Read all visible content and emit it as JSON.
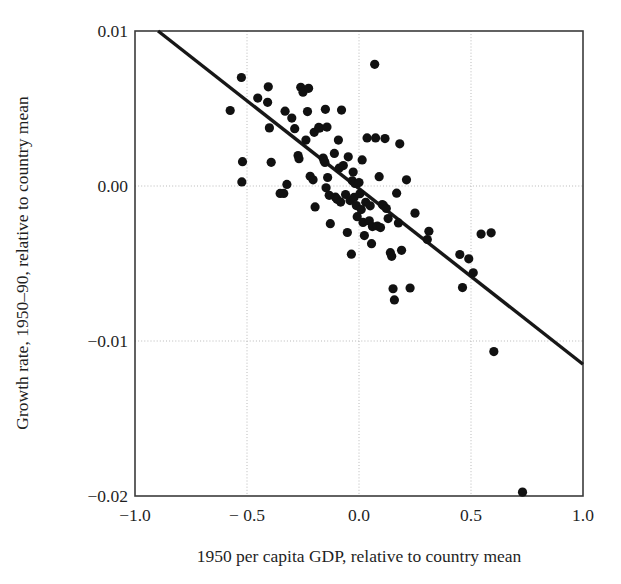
{
  "chart_data": {
    "type": "scatter",
    "title": "",
    "xlabel": "1950 per capita GDP, relative to country mean",
    "ylabel": "Growth rate, 1950–90, relative to country mean",
    "xlim": [
      -1.0,
      1.0
    ],
    "ylim": [
      -0.02,
      0.01
    ],
    "xticks": [
      -1.0,
      -0.5,
      0.0,
      0.5,
      1.0
    ],
    "yticks": [
      0.01,
      0.0,
      -0.01,
      -0.02
    ],
    "xtick_labels": [
      "−1.0",
      "− 0.5",
      "0.0",
      "0.5",
      "1.0"
    ],
    "ytick_labels": [
      "0.01",
      "0.00",
      "−0.01",
      "−0.02"
    ],
    "grid": true,
    "grid_style": "dotted",
    "legend": "none",
    "series": [
      {
        "name": "countries",
        "marker": "circle",
        "color": "#111111",
        "points": [
          [
            -0.575,
            0.00487
          ],
          [
            -0.525,
            0.007
          ],
          [
            -0.52,
            0.00157
          ],
          [
            -0.523,
            0.00026
          ],
          [
            -0.452,
            0.00567
          ],
          [
            -0.405,
            0.0064
          ],
          [
            -0.408,
            0.0054
          ],
          [
            -0.4,
            0.00375
          ],
          [
            -0.392,
            0.00153
          ],
          [
            -0.352,
            -0.00048
          ],
          [
            -0.336,
            -0.00048
          ],
          [
            -0.33,
            0.00483
          ],
          [
            -0.322,
            0.0001
          ],
          [
            -0.3,
            0.00438
          ],
          [
            -0.287,
            0.0037
          ],
          [
            -0.272,
            0.00196
          ],
          [
            -0.268,
            0.00176
          ],
          [
            -0.26,
            0.00637
          ],
          [
            -0.25,
            0.00605
          ],
          [
            -0.237,
            0.00296
          ],
          [
            -0.23,
            0.0048
          ],
          [
            -0.225,
            0.0063
          ],
          [
            -0.218,
            0.00063
          ],
          [
            -0.205,
            0.0004
          ],
          [
            -0.2,
            0.00346
          ],
          [
            -0.196,
            -0.00135
          ],
          [
            -0.18,
            0.00378
          ],
          [
            -0.175,
            0.00374
          ],
          [
            -0.16,
            0.0018
          ],
          [
            -0.156,
            0.00163
          ],
          [
            -0.152,
            0.00152
          ],
          [
            -0.15,
            0.00495
          ],
          [
            -0.147,
            -0.00012
          ],
          [
            -0.143,
            0.0038
          ],
          [
            -0.14,
            0.00055
          ],
          [
            -0.133,
            -0.0006
          ],
          [
            -0.128,
            -0.00243
          ],
          [
            -0.11,
            0.0021
          ],
          [
            -0.105,
            -0.00072
          ],
          [
            -0.098,
            -0.00086
          ],
          [
            -0.092,
            0.00296
          ],
          [
            -0.088,
            0.00116
          ],
          [
            -0.082,
            -0.00104
          ],
          [
            -0.078,
            0.0049
          ],
          [
            -0.07,
            0.00132
          ],
          [
            -0.06,
            -0.00055
          ],
          [
            -0.052,
            -0.003
          ],
          [
            -0.048,
            0.00188
          ],
          [
            -0.04,
            -0.00094
          ],
          [
            -0.034,
            -0.0044
          ],
          [
            -0.03,
            0.00034
          ],
          [
            -0.026,
            0.0009
          ],
          [
            -0.022,
            -0.00074
          ],
          [
            -0.018,
            0.00016
          ],
          [
            -0.012,
            -0.00126
          ],
          [
            -0.008,
            -0.00198
          ],
          [
            0.0,
            0.00022
          ],
          [
            0.004,
            -0.0005
          ],
          [
            0.01,
            -0.00152
          ],
          [
            0.014,
            0.00168
          ],
          [
            0.018,
            -0.00235
          ],
          [
            0.024,
            -0.0032
          ],
          [
            0.03,
            -0.00105
          ],
          [
            0.036,
            0.0031
          ],
          [
            0.046,
            -0.00225
          ],
          [
            0.05,
            -0.00128
          ],
          [
            0.056,
            -0.00372
          ],
          [
            0.06,
            -0.00262
          ],
          [
            0.07,
            0.00785
          ],
          [
            0.074,
            0.0031
          ],
          [
            0.082,
            -0.00258
          ],
          [
            0.09,
            0.0006
          ],
          [
            0.096,
            -0.00268
          ],
          [
            0.104,
            -0.0012
          ],
          [
            0.11,
            -0.00128
          ],
          [
            0.116,
            0.00306
          ],
          [
            0.122,
            -0.00145
          ],
          [
            0.13,
            -0.0021
          ],
          [
            0.14,
            -0.0043
          ],
          [
            0.146,
            -0.00454
          ],
          [
            0.152,
            -0.00663
          ],
          [
            0.158,
            -0.00735
          ],
          [
            0.168,
            -0.00046
          ],
          [
            0.176,
            -0.00238
          ],
          [
            0.182,
            0.00272
          ],
          [
            0.19,
            -0.00415
          ],
          [
            0.212,
            0.0004
          ],
          [
            0.228,
            -0.00658
          ],
          [
            0.25,
            -0.00175
          ],
          [
            0.305,
            -0.00345
          ],
          [
            0.312,
            -0.00292
          ],
          [
            0.45,
            -0.00442
          ],
          [
            0.462,
            -0.00655
          ],
          [
            0.49,
            -0.0047
          ],
          [
            0.51,
            -0.0056
          ],
          [
            0.545,
            -0.0031
          ],
          [
            0.59,
            -0.00302
          ],
          [
            0.602,
            -0.01068
          ],
          [
            0.73,
            -0.01975
          ]
        ]
      }
    ],
    "fit_line": {
      "name": "regression line",
      "color": "#171717",
      "x_start": -0.897,
      "y_start": 0.01,
      "x_end": 1.0,
      "y_end": -0.0115
    }
  }
}
